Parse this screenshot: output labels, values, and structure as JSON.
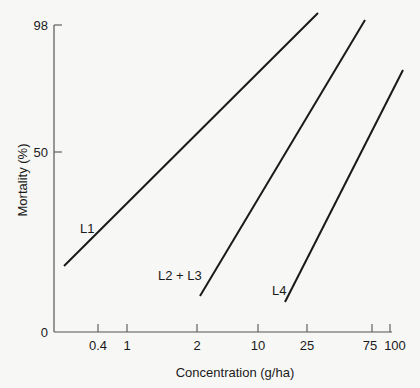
{
  "chart_data": {
    "type": "line",
    "title": "",
    "xlabel": "Concentration (g/ha)",
    "ylabel": "Mortality (%)",
    "x_scale": "log (probit-style)",
    "x_ticks": [
      {
        "label": "0.4",
        "px": 98
      },
      {
        "label": "1",
        "px": 127
      },
      {
        "label": "2",
        "px": 197
      },
      {
        "label": "10",
        "px": 258
      },
      {
        "label": "25",
        "px": 307
      },
      {
        "label": "75",
        "px": 372
      },
      {
        "label": "100",
        "px": 390
      }
    ],
    "y_ticks": [
      {
        "label": "0",
        "px": 332
      },
      {
        "label": "50",
        "px": 152
      },
      {
        "label": "98",
        "px": 25
      }
    ],
    "ylim": [
      0,
      98
    ],
    "grid": false,
    "legend": "none (inline labels)",
    "series": [
      {
        "name": "L1",
        "label_px": [
          80,
          233
        ],
        "x1": 64,
        "y1": 266,
        "x2": 318,
        "y2": 13,
        "approx_points": [
          {
            "x": 0.2,
            "y": 22
          },
          {
            "x": 30,
            "y": 100
          }
        ]
      },
      {
        "name": "L2 + L3",
        "label_px": [
          158,
          280
        ],
        "x1": 200,
        "y1": 296,
        "x2": 365,
        "y2": 20,
        "approx_points": [
          {
            "x": 2,
            "y": 12
          },
          {
            "x": 65,
            "y": 100
          }
        ]
      },
      {
        "name": "L4",
        "label_px": [
          272,
          295
        ],
        "x1": 285,
        "y1": 302,
        "x2": 403,
        "y2": 70,
        "approx_points": [
          {
            "x": 18,
            "y": 10
          },
          {
            "x": 100,
            "y": 80
          }
        ]
      }
    ]
  }
}
